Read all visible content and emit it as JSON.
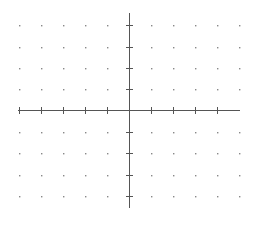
{
  "diagram": {
    "type": "coordinate-grid",
    "origin": {
      "x": 129,
      "y": 110
    },
    "spacing": {
      "x": 22,
      "y": 21.5
    },
    "x_axis": {
      "from": 18,
      "to": 240,
      "ticks_left": 5,
      "ticks_right": 4
    },
    "y_axis": {
      "from": 13,
      "to": 208,
      "ticks_up": 4,
      "ticks_down": 4
    },
    "dot_columns": [
      19,
      41,
      63,
      85,
      107,
      151,
      173,
      195,
      217,
      239
    ],
    "dot_rows": [
      25,
      47,
      68,
      89,
      132,
      153,
      175,
      196
    ],
    "colors": {
      "axis": "#555555",
      "dot": "#888888",
      "background": "#ffffff"
    }
  }
}
